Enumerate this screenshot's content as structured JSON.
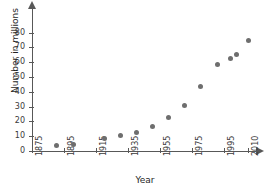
{
  "chart_data": {
    "type": "scatter",
    "title": "",
    "xlabel": "Year",
    "ylabel": "Number in millions",
    "xlim": [
      1875,
      2015
    ],
    "ylim": [
      0,
      85
    ],
    "grid": false,
    "legend": null,
    "x_ticks": [
      "1875",
      "1895",
      "1915",
      "1935",
      "1955",
      "1975",
      "1995",
      "2010"
    ],
    "x_tick_values": [
      1875,
      1895,
      1915,
      1935,
      1955,
      1975,
      1995,
      2010
    ],
    "y_ticks": [
      "0",
      "10",
      "20",
      "30",
      "40",
      "50",
      "60",
      "70",
      "80"
    ],
    "y_tick_values": [
      0,
      10,
      20,
      30,
      40,
      50,
      60,
      70,
      80
    ],
    "marker_color": "#6e6e6e",
    "axis_color": "#585858",
    "points": [
      {
        "x": 1890,
        "y": 4.0
      },
      {
        "x": 1901,
        "y": 4.7
      },
      {
        "x": 1920,
        "y": 8.5
      },
      {
        "x": 1930,
        "y": 10.2
      },
      {
        "x": 1940,
        "y": 12.8
      },
      {
        "x": 1950,
        "y": 16.5
      },
      {
        "x": 1960,
        "y": 22.3
      },
      {
        "x": 1970,
        "y": 30.5
      },
      {
        "x": 1980,
        "y": 43.8
      },
      {
        "x": 1991,
        "y": 58.3
      },
      {
        "x": 1999,
        "y": 62.3
      },
      {
        "x": 2003,
        "y": 65.3
      },
      {
        "x": 2010,
        "y": 74.8
      }
    ]
  }
}
